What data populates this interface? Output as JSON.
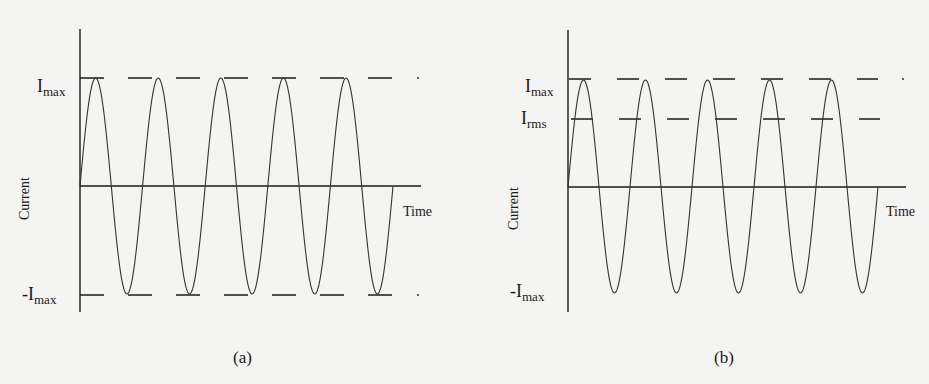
{
  "panels": [
    {
      "id": "a",
      "caption": "(a)",
      "y_axis_label": "Current",
      "x_axis_label": "Time",
      "imax_label": "I",
      "imax_sub": "max",
      "neg_imax_label": "-I",
      "neg_imax_sub": "max",
      "show_rms": false,
      "geom": {
        "axis_x": 80,
        "axis_top": 29,
        "axis_bottom": 312,
        "zero_y": 186,
        "time_end_x": 421,
        "imax_y": 78,
        "neg_imax_y": 295,
        "wave_end_x": 393,
        "cycles": 5,
        "peak_y": 78,
        "trough_y": 294,
        "dash_end_x": 392,
        "dot_x": 418
      }
    },
    {
      "id": "b",
      "caption": "(b)",
      "y_axis_label": "Current",
      "x_axis_label": "Time",
      "imax_label": "I",
      "imax_sub": "max",
      "rms_label": "I",
      "rms_sub": "rms",
      "neg_imax_label": "-I",
      "neg_imax_sub": "max",
      "show_rms": true,
      "geom": {
        "axis_x": 568,
        "axis_top": 30,
        "axis_bottom": 312,
        "zero_y": 187,
        "time_end_x": 906,
        "imax_y": 79,
        "rms_y": 119,
        "wave_end_x": 878,
        "cycles": 5,
        "peak_y": 80,
        "trough_y": 293,
        "dash_end_x": 878,
        "dot_x": 903
      }
    }
  ]
}
